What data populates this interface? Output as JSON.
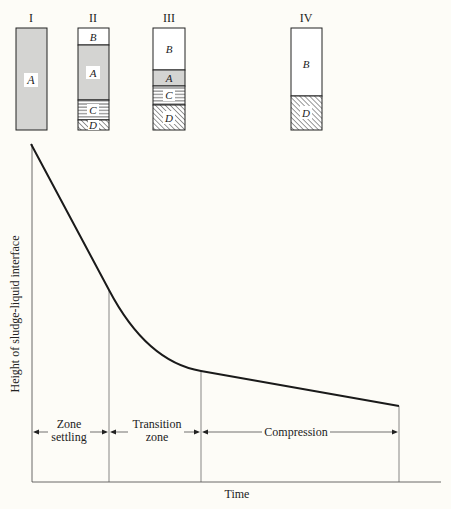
{
  "figure": {
    "type": "settling-curve-diagram",
    "colors": {
      "background": "#fdfcf7",
      "ink": "#222222",
      "sludge_gray": "#d4d4d2",
      "clear_white": "#ffffff"
    }
  },
  "columns": [
    {
      "label": "I",
      "layers": [
        {
          "zone": "A",
          "pattern": "gray",
          "top_frac": 0.0,
          "bottom_frac": 1.0
        }
      ]
    },
    {
      "label": "II",
      "layers": [
        {
          "zone": "B",
          "pattern": "white",
          "top_frac": 0.0,
          "bottom_frac": 0.17
        },
        {
          "zone": "A",
          "pattern": "gray",
          "top_frac": 0.17,
          "bottom_frac": 0.7
        },
        {
          "zone": "C",
          "pattern": "horizontal-lines",
          "top_frac": 0.7,
          "bottom_frac": 0.9
        },
        {
          "zone": "D",
          "pattern": "diagonal-hatch",
          "top_frac": 0.9,
          "bottom_frac": 1.0
        }
      ]
    },
    {
      "label": "III",
      "layers": [
        {
          "zone": "B",
          "pattern": "white",
          "top_frac": 0.0,
          "bottom_frac": 0.41
        },
        {
          "zone": "A",
          "pattern": "gray",
          "top_frac": 0.41,
          "bottom_frac": 0.57
        },
        {
          "zone": "C",
          "pattern": "horizontal-lines",
          "top_frac": 0.57,
          "bottom_frac": 0.75
        },
        {
          "zone": "D",
          "pattern": "diagonal-hatch",
          "top_frac": 0.75,
          "bottom_frac": 1.0
        }
      ]
    },
    {
      "label": "IV",
      "layers": [
        {
          "zone": "B",
          "pattern": "white",
          "top_frac": 0.0,
          "bottom_frac": 0.67
        },
        {
          "zone": "D",
          "pattern": "diagonal-hatch",
          "top_frac": 0.67,
          "bottom_frac": 1.0
        }
      ]
    }
  ],
  "graph": {
    "y_axis_label": "Height of sludge-liquid interface",
    "x_axis_label": "Time",
    "curve": {
      "description": "Interface height vs time: steep linear drop (zone settling), curved transition, then gentle linear slope (compression)",
      "points_relative": [
        {
          "t": 0.0,
          "h": 1.0
        },
        {
          "t": 0.21,
          "h": 0.57
        },
        {
          "t": 0.46,
          "h": 0.33
        },
        {
          "t": 1.0,
          "h": 0.22
        }
      ]
    },
    "regions": [
      {
        "label_line1": "Zone",
        "label_line2": "settling"
      },
      {
        "label_line1": "Transition",
        "label_line2": "zone"
      },
      {
        "label_line1": "Compression",
        "label_line2": ""
      }
    ]
  }
}
